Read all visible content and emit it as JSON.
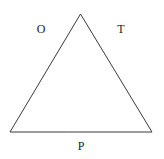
{
  "diagram": {
    "shape": "triangle",
    "stroke_color": "#3a3a3a",
    "labels": {
      "left_side": "O",
      "right_side": "T",
      "base": "P"
    }
  }
}
